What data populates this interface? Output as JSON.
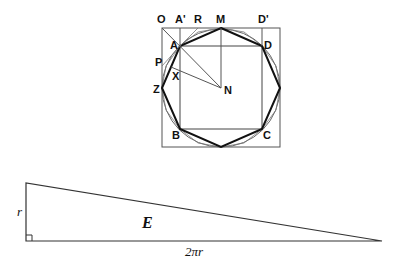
{
  "figure_top": {
    "description": "Square with inscribed circle, regular octagon, and inner square",
    "labels": {
      "O": "O",
      "A_prime": "A'",
      "R": "R",
      "M": "M",
      "D_prime": "D'",
      "A": "A",
      "D": "D",
      "P": "P",
      "X": "X",
      "Z": "Z",
      "N": "N",
      "B": "B",
      "C": "C"
    },
    "colors": {
      "thick": "#111111",
      "thin": "#555555"
    }
  },
  "figure_bottom": {
    "description": "Right triangle with legs r and 2πr, area E",
    "side_label_vertical": "r",
    "side_label_horizontal": "2πr",
    "area_label": "E"
  }
}
